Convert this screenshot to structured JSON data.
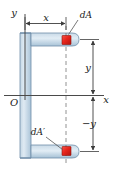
{
  "figure": {
    "type": "engineering-cross-section-diagram",
    "canvas": {
      "width": 115,
      "height": 171
    },
    "colors": {
      "section_fill": "#b9cfe0",
      "section_fill_light": "#d6e4ef",
      "section_outline": "#6f8ea8",
      "element_red": "#e8251c",
      "element_red_dark": "#b01610",
      "axis": "#4a4a4a",
      "leader": "#555555",
      "dashed": "#777777",
      "text": "#1a1a1a",
      "background": "#ffffff"
    },
    "axes": {
      "y_axis_label": "y",
      "x_axis_label": "x",
      "origin_label": "O"
    },
    "dimensions": [
      {
        "name": "horizontal-distance",
        "label": "x",
        "orientation": "horizontal",
        "arrow": "double"
      },
      {
        "name": "upper-vertical-distance",
        "label": "y",
        "orientation": "vertical",
        "arrow": "double"
      },
      {
        "name": "lower-vertical-distance",
        "label": "−y",
        "orientation": "vertical",
        "arrow": "double"
      }
    ],
    "elements": [
      {
        "name": "area-element-upper",
        "label": "dA",
        "position": "upper-flange",
        "color": "#e8251c"
      },
      {
        "name": "area-element-lower",
        "label": "dA′",
        "position": "lower-flange",
        "color": "#e8251c"
      }
    ]
  }
}
